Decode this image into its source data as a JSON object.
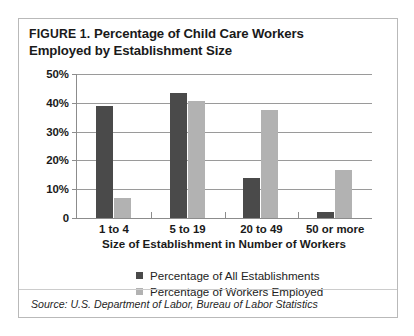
{
  "figure": {
    "label": "FIGURE 1.",
    "title_rest": " Percentage of Child Care Workers",
    "title_line2": "Employed by Establishment Size",
    "source": "Source: U.S. Department of Labor, Bureau of Labor Statistics"
  },
  "colors": {
    "series_dark": "#4a4a4a",
    "series_light": "#b2b2b2",
    "axis": "#8c8c8c",
    "grid": "#9a9a9a",
    "border": "#b9b9b9"
  },
  "chart_data": {
    "type": "bar",
    "title": "FIGURE 1. Percentage of Child Care Workers Employed by Establishment Size",
    "xlabel": "Size of Establishment in Number of Workers",
    "ylabel": "",
    "categories": [
      "1 to 4",
      "5 to 19",
      "20 to 49",
      "50 or more"
    ],
    "series": [
      {
        "name": "Percentage of All Establishments",
        "color": "#4a4a4a",
        "values": [
          39,
          43.5,
          14,
          2
        ]
      },
      {
        "name": "Percentage of Workers Employed",
        "color": "#b2b2b2",
        "values": [
          7,
          40.5,
          37.5,
          16.5
        ]
      }
    ],
    "ylim": [
      0,
      50
    ],
    "yticks": [
      0,
      10,
      20,
      30,
      40,
      50
    ],
    "ytick_labels": [
      "0",
      "10%",
      "20%",
      "30%",
      "40%",
      "50%"
    ],
    "grid": true,
    "legend_position": "bottom"
  }
}
